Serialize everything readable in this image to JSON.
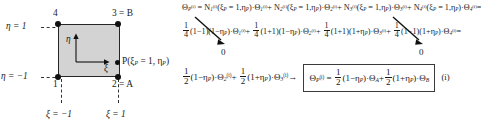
{
  "figure": {
    "type": "finite-element master element and shape function derivation",
    "caption_tag": "(i)"
  },
  "diagram": {
    "name": "master-element-square",
    "fill_color": "#d3d3d3",
    "edge_color": "#262626",
    "nodes": [
      {
        "id": "1",
        "label": "1",
        "xi": -1,
        "eta": -1,
        "position": "bottom-left"
      },
      {
        "id": "2",
        "label": "2 = A",
        "xi": 1,
        "eta": -1,
        "position": "bottom-right"
      },
      {
        "id": "3",
        "label": "3 = B",
        "xi": 1,
        "eta": 1,
        "position": "top-right"
      },
      {
        "id": "4",
        "label": "4",
        "xi": -1,
        "eta": 1,
        "position": "top-left"
      }
    ],
    "point_P": {
      "marker": "P",
      "label": "P(ξ",
      "label_sub": "P",
      "label_mid": " = 1, η",
      "label_sub2": "P",
      "label_end": ")"
    },
    "axis_labels": {
      "vertical": "η",
      "horizontal": "ξ"
    },
    "guides": [
      {
        "name": "eta-top",
        "text_lead": "η = 1",
        "orientation": "horizontal"
      },
      {
        "name": "eta-bottom",
        "text_lead": "η = −1",
        "orientation": "horizontal"
      },
      {
        "name": "xi-left",
        "text_lead": "ξ = −1",
        "orientation": "vertical"
      },
      {
        "name": "xi-right",
        "text_lead": "ξ = 1",
        "orientation": "vertical"
      }
    ]
  },
  "equations": {
    "line1": {
      "lhs_theta": "Θ",
      "lhs_sub": "P",
      "lhs_sup": "(i)",
      "eq": "=",
      "terms": [
        {
          "N": "N",
          "N_sub": "1",
          "N_sup": "(i)",
          "args": "(ξ",
          "args_sub": "P",
          "args_mid": " = 1,η",
          "args_sub2": "P",
          "args_end": ")",
          "dot": "·",
          "theta": "Θ",
          "theta_sub": "1",
          "theta_sup": "(i)",
          "op": "+"
        },
        {
          "N": "N",
          "N_sub": "2",
          "N_sup": "(i)",
          "args": "(ξ",
          "args_sub": "P",
          "args_mid": " = 1,η",
          "args_sub2": "P",
          "args_end": ")",
          "dot": "·",
          "theta": "Θ",
          "theta_sub": "2",
          "theta_sup": "(i)",
          "op": "+"
        },
        {
          "N": "N",
          "N_sub": "3",
          "N_sup": "(i)",
          "args": "(ξ",
          "args_sub": "P",
          "args_mid": " = 1,η",
          "args_sub2": "P",
          "args_end": ")",
          "dot": "·",
          "theta": "Θ",
          "theta_sub": "3",
          "theta_sup": "(i)",
          "op": "+"
        },
        {
          "N": "N",
          "N_sub": "4",
          "N_sup": "(i)",
          "args": "(ξ",
          "args_sub": "P",
          "args_mid": " = 1,η",
          "args_sub2": "P",
          "args_end": ")",
          "dot": "·",
          "theta": "Θ",
          "theta_sub": "4",
          "theta_sup": "(i)",
          "op": "="
        }
      ]
    },
    "line2": {
      "terms": [
        {
          "num": "1",
          "den": "4",
          "factors": "(1−1)(1−η",
          "factors_sub": "P",
          "factors_end": ")",
          "dot": "·",
          "theta": "Θ",
          "theta_sub": "1",
          "theta_sup": "(i)",
          "op": "+"
        },
        {
          "num": "1",
          "den": "4",
          "factors": "(1+1)(1−η",
          "factors_sub": "P",
          "factors_end": ")",
          "dot": "·",
          "theta": "Θ",
          "theta_sub": "2",
          "theta_sup": "(i)",
          "op": "+"
        },
        {
          "num": "1",
          "den": "4",
          "factors": "(1+1)(1+η",
          "factors_sub": "P",
          "factors_end": ")",
          "dot": "·",
          "theta": "Θ",
          "theta_sub": "3",
          "theta_sup": "(i)",
          "op": "+"
        },
        {
          "num": "1",
          "den": "4",
          "factors": "(1−1)(1+η",
          "factors_sub": "P",
          "factors_end": ")",
          "dot": "·",
          "theta": "Θ",
          "theta_sub": "4",
          "theta_sup": "(i)",
          "op": "="
        }
      ],
      "annotations": [
        {
          "name": "zero-left",
          "text": "0",
          "points_to": "first-term"
        },
        {
          "name": "zero-right",
          "text": "0",
          "points_to": "fourth-term"
        }
      ]
    },
    "line3": {
      "terms": [
        {
          "num": "1",
          "den": "2",
          "factors": "(1−η",
          "factors_sub": "P",
          "factors_end": ")",
          "dot": "·",
          "theta": "Θ",
          "theta_sub": "2",
          "theta_sup": "(i)",
          "op": "+"
        },
        {
          "num": "1",
          "den": "2",
          "factors": "(1+η",
          "factors_sub": "P",
          "factors_end": ")",
          "dot": "·",
          "theta": "Θ",
          "theta_sub": "3",
          "theta_sup": "(i)",
          "op": "→"
        }
      ],
      "boxed": {
        "lhs_theta": "Θ",
        "lhs_sub": "P",
        "lhs_sup": "(i)",
        "eq": "=",
        "terms": [
          {
            "num": "1",
            "den": "2",
            "factors": "(1−η",
            "factors_sub": "P",
            "factors_end": ")",
            "dot": "·",
            "theta": "Θ",
            "theta_sub": "A",
            "op": "+"
          },
          {
            "num": "1",
            "den": "2",
            "factors": "(1+η",
            "factors_sub": "P",
            "factors_end": ")",
            "dot": "·",
            "theta": "Θ",
            "theta_sub": "B",
            "op": ""
          }
        ]
      },
      "tag": "(i)"
    }
  }
}
